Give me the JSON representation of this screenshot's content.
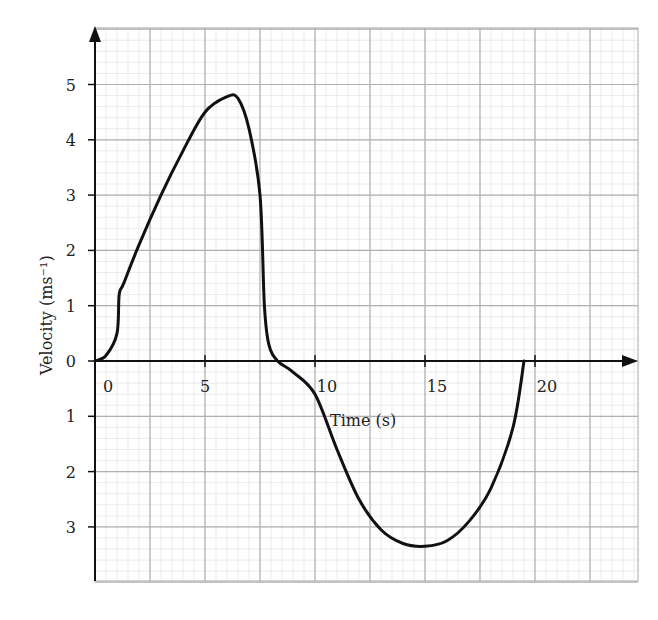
{
  "chart_data": {
    "type": "line",
    "title": "",
    "xlabel": "Time (s)",
    "ylabel": "Velocity (ms⁻¹)",
    "xlim": [
      0,
      24.8
    ],
    "ylim": [
      -4,
      6
    ],
    "grid": true,
    "x_ticks": [
      0,
      5,
      10,
      15,
      20
    ],
    "x_tick_labels": [
      "0",
      "5",
      "10",
      "15",
      "20"
    ],
    "y_ticks": [
      5,
      4,
      3,
      2,
      1,
      0,
      -1,
      -2,
      -3
    ],
    "y_tick_labels": [
      "5",
      "4",
      "3",
      "2",
      "1",
      "0",
      "1",
      "2",
      "3"
    ],
    "series": [
      {
        "name": "velocity",
        "x": [
          0,
          0.5,
          1,
          1.1,
          1.3,
          2,
          3,
          4,
          5,
          6,
          6.5,
          7,
          7.5,
          7.7,
          7.9,
          8.3,
          9,
          10,
          11,
          12,
          13,
          14,
          15,
          16,
          17,
          18,
          19,
          19.5
        ],
        "y": [
          0,
          0.1,
          0.5,
          1.2,
          1.4,
          2.1,
          3.0,
          3.8,
          4.5,
          4.78,
          4.75,
          4.2,
          3.0,
          1.0,
          0.3,
          0,
          -0.2,
          -0.6,
          -1.6,
          -2.5,
          -3.05,
          -3.3,
          -3.35,
          -3.25,
          -2.9,
          -2.3,
          -1.2,
          0
        ]
      }
    ],
    "colors": {
      "curve": "#111111",
      "major_grid": "#b0b0b0",
      "minor_grid": "#e2e2e2",
      "axis": "#111111"
    }
  }
}
